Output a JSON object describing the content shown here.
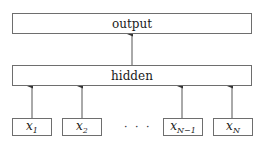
{
  "diagram": {
    "output_box": {
      "label": "output"
    },
    "hidden_box": {
      "label": "hidden"
    },
    "inputs": [
      {
        "base": "x",
        "sub": "1"
      },
      {
        "base": "x",
        "sub": "2"
      },
      {
        "base": "x",
        "sub": "N−1"
      },
      {
        "base": "x",
        "sub": "N"
      }
    ],
    "ellipsis": "· · ·",
    "colors": {
      "border": "#6e6e6e",
      "arrow": "#333333",
      "background": "#ffffff"
    }
  }
}
